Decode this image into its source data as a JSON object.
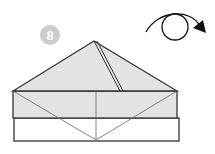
{
  "diagram": {
    "type": "origami-step",
    "step_number": "8",
    "step_badge_color": "#cccccc",
    "paper_colored_side": "#e3e3e3",
    "paper_white_side": "#ffffff",
    "line_color": "#333333",
    "crease_color": "#555555",
    "instruction_symbol": "turn-over-icon",
    "shapes": {
      "triangle_flap": {
        "apex": [
          94,
          41
        ],
        "left": [
          13,
          91
        ],
        "right": [
          177,
          91
        ]
      },
      "colored_band": {
        "x": 13,
        "y": 91,
        "w": 164,
        "h": 27
      },
      "white_strip": {
        "x": 14,
        "y": 118,
        "w": 165,
        "h": 23
      },
      "center_crease_x": 96,
      "diagonal_meet": [
        96,
        140
      ]
    }
  }
}
